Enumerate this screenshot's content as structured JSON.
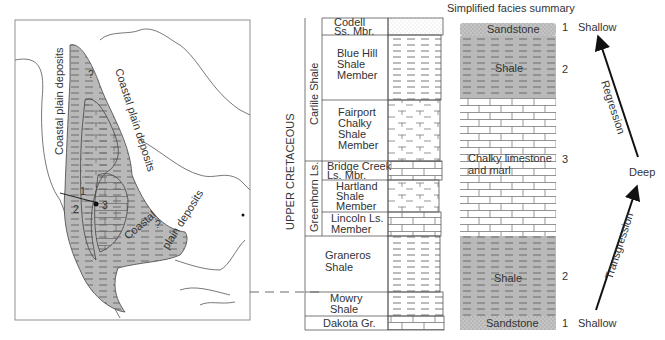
{
  "map": {
    "labels": {
      "coastal_west": "Coastal plain deposits",
      "coastal_east": "Coastal plain deposits",
      "coastal_south_1": "Coastal",
      "coastal_south_2": "plain deposits",
      "q1": "?",
      "q2": "?",
      "pt1": "1",
      "pt2": "2",
      "pt3": "3"
    }
  },
  "column": {
    "era_label": "UPPER CRETACEOUS",
    "formations": [
      {
        "name": "Carlile Shale"
      },
      {
        "name": "Greenhorn Ls."
      }
    ],
    "units": [
      {
        "lines": [
          "Codell",
          "Ss. Mbr."
        ]
      },
      {
        "lines": [
          "Blue Hill",
          "Shale",
          "Member"
        ]
      },
      {
        "lines": [
          "Fairport",
          "Chalky",
          "Shale",
          "Member"
        ]
      },
      {
        "lines": [
          "Bridge Creek",
          "Ls. Mbr."
        ]
      },
      {
        "lines": [
          "Hartland",
          "Shale",
          "Member"
        ]
      },
      {
        "lines": [
          "Lincoln Ls.",
          "Member"
        ]
      },
      {
        "lines": [
          "Graneros",
          "Shale"
        ]
      },
      {
        "lines": [
          "Mowry",
          "Shale"
        ]
      },
      {
        "lines": [
          "Dakota Gr."
        ]
      }
    ]
  },
  "facies": {
    "title": "Simplified facies summary",
    "blocks": [
      {
        "label": "Sandstone",
        "number": "1"
      },
      {
        "label": "Shale",
        "number": "2"
      },
      {
        "label_lines": [
          "Chalky limestone",
          "and marl"
        ],
        "number": "3"
      },
      {
        "label": "Shale",
        "number": "2"
      },
      {
        "label": "Sandstone",
        "number": "1"
      }
    ]
  },
  "cycle": {
    "top": "Shallow",
    "middle": "Deep",
    "bottom": "Shallow",
    "upper_arrow": "Regression",
    "lower_arrow": "Transgression"
  }
}
